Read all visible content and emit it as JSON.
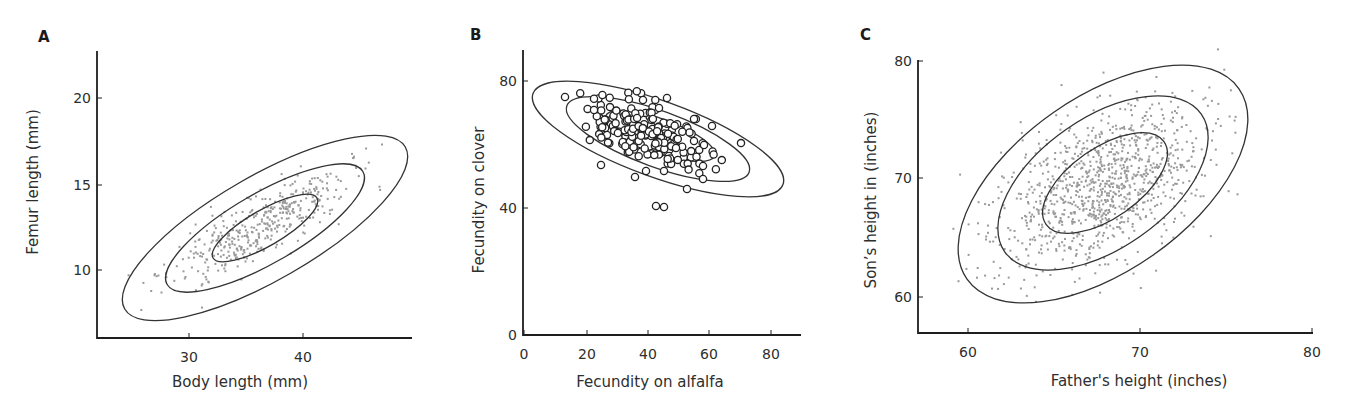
{
  "figure": {
    "panels": [
      {
        "id": "A",
        "letter": "A",
        "letter_pos": [
          38,
          42
        ],
        "xlabel": "Body length (mm)",
        "ylabel": "Femur length (mm)",
        "frame": {
          "x0": 97,
          "y0": 338,
          "x_end": 412,
          "y_top": 51
        },
        "x_ticks": [
          {
            "label": "30",
            "px": 189
          },
          {
            "label": "40",
            "px": 303
          }
        ],
        "y_ticks": [
          {
            "label": "20",
            "py": 98
          },
          {
            "label": "15",
            "py": 185
          },
          {
            "label": "10",
            "py": 270
          }
        ],
        "xlabel_pos": [
          240,
          387
        ],
        "ylabel_pos": [
          38,
          182
        ],
        "contours": [
          {
            "cx": 265,
            "cy": 228,
            "rx": 60,
            "ry": 18,
            "rot": -30
          },
          {
            "cx": 265,
            "cy": 228,
            "rx": 113,
            "ry": 35,
            "rot": -30
          },
          {
            "cx": 265,
            "cy": 228,
            "rx": 162,
            "ry": 52,
            "rot": -30
          }
        ],
        "points": {
          "style": "dot",
          "n": 420,
          "cx": 262,
          "cy": 226,
          "sa": 52,
          "sb": 14,
          "rot": -30,
          "seed": 11
        }
      },
      {
        "id": "B",
        "letter": "B",
        "letter_pos": [
          470,
          40
        ],
        "xlabel": "Fecundity on alfalfa",
        "ylabel": "Fecundity on clover",
        "frame": {
          "x0": 523,
          "y0": 335,
          "x_end": 801,
          "y_top": 50
        },
        "x_ticks": [
          {
            "label": "0",
            "px": 524
          },
          {
            "label": "20",
            "px": 587
          },
          {
            "label": "40",
            "px": 648
          },
          {
            "label": "60",
            "px": 709
          },
          {
            "label": "80",
            "px": 771
          }
        ],
        "y_ticks": [
          {
            "label": "80",
            "py": 81
          },
          {
            "label": "40",
            "py": 208
          },
          {
            "label": "0",
            "py": 335
          }
        ],
        "xlabel_pos": [
          650,
          387
        ],
        "ylabel_pos": [
          484,
          200
        ],
        "contours": [
          {
            "cx": 660,
            "cy": 136,
            "rx": 58,
            "ry": 17,
            "rot": 20
          },
          {
            "cx": 658,
            "cy": 139,
            "rx": 97,
            "ry": 28,
            "rot": 20
          },
          {
            "cx": 658,
            "cy": 139,
            "rx": 133,
            "ry": 38,
            "rot": 20
          }
        ],
        "points": {
          "style": "ring",
          "n": 190,
          "cx": 646,
          "cy": 133,
          "sa": 30,
          "sb": 13,
          "rot": 18,
          "seed": 7,
          "extra": [
            [
              565,
              97
            ],
            [
              594,
              110
            ],
            [
              601,
              165
            ],
            [
              635,
              177
            ],
            [
              664,
              171
            ],
            [
              667,
              98
            ],
            [
              694,
              141
            ],
            [
              704,
              145
            ],
            [
              712,
              126
            ],
            [
              703,
              166
            ],
            [
              703,
              179
            ],
            [
              659,
              108
            ],
            [
              643,
              100
            ],
            [
              694,
              119
            ]
          ],
          "outliers": [
            [
              656,
              206
            ],
            [
              664,
              207
            ],
            [
              687,
              189
            ],
            [
              646,
              171
            ]
          ]
        }
      },
      {
        "id": "C",
        "letter": "C",
        "letter_pos": [
          860,
          40
        ],
        "xlabel": "Father's height (inches)",
        "ylabel": "Son’s height in (inches)",
        "frame": {
          "x0": 918,
          "y0": 333,
          "x_end": 1313,
          "y_top": 60
        },
        "x_ticks": [
          {
            "label": "60",
            "px": 968
          },
          {
            "label": "70",
            "px": 1140
          },
          {
            "label": "80",
            "px": 1312
          }
        ],
        "y_ticks": [
          {
            "label": "80",
            "py": 61
          },
          {
            "label": "70",
            "py": 178
          },
          {
            "label": "60",
            "py": 297
          }
        ],
        "xlabel_pos": [
          1139,
          386
        ],
        "ylabel_pos": [
          876,
          200
        ],
        "contours": [
          {
            "cx": 1105,
            "cy": 183,
            "rx": 72,
            "ry": 35,
            "rot": -35
          },
          {
            "cx": 1103,
            "cy": 183,
            "rx": 120,
            "ry": 65,
            "rot": -35
          },
          {
            "cx": 1103,
            "cy": 184,
            "rx": 166,
            "ry": 87,
            "rot": -35
          }
        ],
        "points": {
          "style": "dot",
          "n": 1050,
          "cx": 1100,
          "cy": 186,
          "sa": 58,
          "sb": 33,
          "rot": -35,
          "seed": 23
        }
      }
    ]
  },
  "chart_data": [
    {
      "type": "scatter",
      "panel": "A",
      "title": "",
      "xlabel": "Body length (mm)",
      "ylabel": "Femur length (mm)",
      "x_ticks": [
        30,
        40
      ],
      "y_ticks": [
        10,
        15,
        20
      ],
      "xlim": [
        22,
        50
      ],
      "ylim": [
        6.2,
        22.8
      ],
      "grid": false,
      "legend": null,
      "marker": "small gray dots",
      "approx_n_points": 420,
      "correlation": "strong positive",
      "approx_mean": {
        "x": 36.5,
        "y": 12.5
      },
      "contours": "three concentric probability ellipses (bivariate normal)",
      "ellipse_extents": [
        {
          "level": "inner",
          "x_range": [
            32.0,
            41.5
          ],
          "y_range": [
            10.3,
            14.7
          ]
        },
        {
          "level": "middle",
          "x_range": [
            28.0,
            45.5
          ],
          "y_range": [
            8.4,
            16.4
          ]
        },
        {
          "level": "outer",
          "x_range": [
            24.0,
            48.5
          ],
          "y_range": [
            6.8,
            18.1
          ]
        }
      ]
    },
    {
      "type": "scatter",
      "panel": "B",
      "title": "",
      "xlabel": "Fecundity on alfalfa",
      "ylabel": "Fecundity on clover",
      "x_ticks": [
        0,
        20,
        40,
        60,
        80
      ],
      "y_ticks": [
        0,
        40,
        80
      ],
      "xlim": [
        0,
        90
      ],
      "ylim": [
        0,
        90
      ],
      "grid": false,
      "legend": null,
      "marker": "open circles",
      "approx_n_points": 200,
      "correlation": "negative",
      "approx_mean": {
        "x": 43,
        "y": 63
      },
      "notable_points": [
        [
          15,
          76
        ],
        [
          22,
          72
        ],
        [
          24,
          60
        ],
        [
          37,
          49
        ],
        [
          49,
          45
        ],
        [
          44,
          41
        ],
        [
          46,
          40
        ],
        [
          58,
          67
        ]
      ],
      "contours": "three concentric probability ellipses",
      "ellipse_extents": [
        {
          "level": "inner",
          "x_range": [
            25,
            62
          ],
          "y_range": [
            53,
            70
          ]
        },
        {
          "level": "middle",
          "x_range": [
            14,
            74
          ],
          "y_range": [
            49,
            75
          ]
        },
        {
          "level": "outer",
          "x_range": [
            3,
            85
          ],
          "y_range": [
            43,
            80
          ]
        }
      ]
    },
    {
      "type": "scatter",
      "panel": "C",
      "title": "",
      "xlabel": "Father's height (inches)",
      "ylabel": "Son’s height in (inches)",
      "x_ticks": [
        60,
        70,
        80
      ],
      "y_ticks": [
        60,
        70,
        80
      ],
      "xlim": [
        57.1,
        80
      ],
      "ylim": [
        57,
        80
      ],
      "grid": false,
      "legend": null,
      "marker": "small gray dots",
      "approx_n_points": 1050,
      "correlation": "moderate positive",
      "approx_mean": {
        "x": 67.7,
        "y": 69.0
      },
      "contours": "three concentric probability ellipses",
      "ellipse_extents": [
        {
          "level": "inner",
          "x_range": [
            64.4,
            71.7
          ],
          "y_range": [
            65.4,
            73.8
          ]
        },
        {
          "level": "middle",
          "x_range": [
            61.8,
            74.0
          ],
          "y_range": [
            62.3,
            76.9
          ]
        },
        {
          "level": "outer",
          "x_range": [
            59.5,
            76.3
          ],
          "y_range": [
            59.6,
            79.7
          ]
        }
      ]
    }
  ]
}
